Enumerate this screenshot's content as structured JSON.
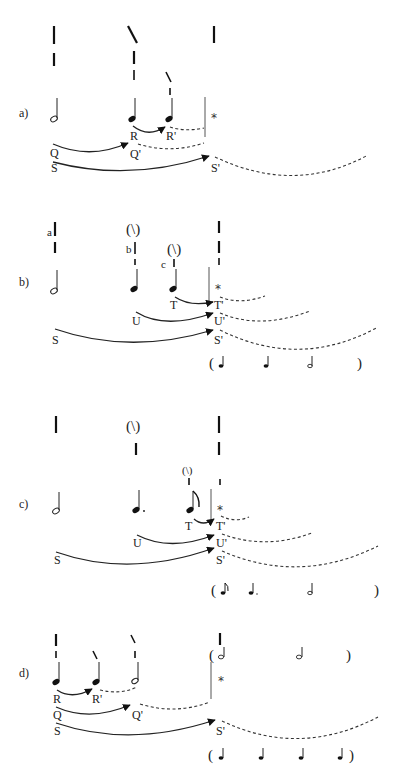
{
  "figure": {
    "panels": [
      {
        "id": "a",
        "label": "a)",
        "notes": [
          "half-note",
          "quarter-note R",
          "quarter-note R'"
        ],
        "points": {
          "Q": "Q",
          "Qp": "Q'",
          "R": "R",
          "Rp": "R'",
          "S": "S",
          "Sp": "S'"
        },
        "star": "*"
      },
      {
        "id": "b",
        "label": "b)",
        "letters": {
          "a": "a",
          "b": "b",
          "c": "c"
        },
        "paren_marks": [
          "(\\)",
          "(\\)"
        ],
        "points": {
          "T": "T",
          "Tp": "T'",
          "U": "U",
          "Up": "U'",
          "S": "S",
          "Sp": "S'"
        },
        "star": "*",
        "projection": {
          "open": "(",
          "close": ")",
          "rhythm": [
            "quarter",
            "quarter",
            "half"
          ]
        }
      },
      {
        "id": "c",
        "label": "c)",
        "paren_marks": [
          "(\\)",
          "(\\)"
        ],
        "points": {
          "T": "T",
          "Tp": "T'",
          "U": "U",
          "Up": "U'",
          "S": "S",
          "Sp": "S'"
        },
        "star": "*",
        "projection": {
          "open": "(",
          "close": ")",
          "rhythm": [
            "eighth",
            "dotted-quarter",
            "half"
          ]
        }
      },
      {
        "id": "d",
        "label": "d)",
        "points": {
          "R": "R",
          "Rp": "R'",
          "Q": "Q",
          "Qp": "Q'",
          "S": "S",
          "Sp": "S'"
        },
        "star": "*",
        "projection_top": {
          "open": "(",
          "close": ")",
          "rhythm": [
            "half",
            "half"
          ]
        },
        "projection": {
          "open": "(",
          "close": ")",
          "rhythm": [
            "quarter",
            "quarter",
            "quarter",
            "quarter"
          ]
        }
      }
    ]
  }
}
